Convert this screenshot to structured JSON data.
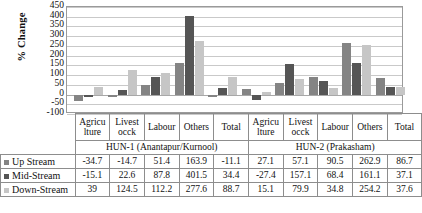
{
  "chart_data": {
    "type": "bar",
    "title": "",
    "xlabel": "",
    "ylabel": "% Change",
    "ylim": [
      -100,
      450
    ],
    "ytick_step": 50,
    "yticks": [
      450,
      400,
      350,
      300,
      250,
      200,
      150,
      100,
      50,
      0,
      -50,
      -100
    ],
    "grid": true,
    "legend_position": "data-table-left",
    "groups": [
      {
        "name": "HUN-1 (Anantapur/Kurnool)",
        "categories": [
          "Agricu lture",
          "Livest occk",
          "Labour",
          "Others",
          "Total"
        ]
      },
      {
        "name": "HUN-2 (Prakasham)",
        "categories": [
          "Agricu lture",
          "Livest occk",
          "Labour",
          "Others",
          "Total"
        ]
      }
    ],
    "categories": [
      "Agricu lture",
      "Livest occk",
      "Labour",
      "Others",
      "Total",
      "Agricu lture",
      "Livest occk",
      "Labour",
      "Others",
      "Total"
    ],
    "series": [
      {
        "name": "Up Stream",
        "color": "#848484",
        "values": [
          -34.7,
          -14.7,
          51.4,
          163.9,
          -11.1,
          27.1,
          57.1,
          90.5,
          262.9,
          86.7
        ]
      },
      {
        "name": "Mid-Stream",
        "color": "#555555",
        "values": [
          -15.1,
          22.6,
          87.8,
          401.5,
          34.4,
          -27.4,
          157.1,
          68.4,
          161.1,
          37.1
        ]
      },
      {
        "name": "Down-Stream",
        "color": "#c6c6c6",
        "values": [
          39,
          124.5,
          112.2,
          277.6,
          88.7,
          15.1,
          79.9,
          34.8,
          254.2,
          37.6
        ]
      }
    ]
  },
  "table": {
    "row_labels": [
      "Up Stream",
      "Mid-Stream",
      "Down-Stream"
    ],
    "rows": [
      [
        "-34.7",
        "-14.7",
        "51.4",
        "163.9",
        "-11.1",
        "27.1",
        "57.1",
        "90.5",
        "262.9",
        "86.7"
      ],
      [
        "-15.1",
        "22.6",
        "87.8",
        "401.5",
        "34.4",
        "-27.4",
        "157.1",
        "68.4",
        "161.1",
        "37.1"
      ],
      [
        "39",
        "124.5",
        "112.2",
        "277.6",
        "88.7",
        "15.1",
        "79.9",
        "34.8",
        "254.2",
        "37.6"
      ]
    ]
  }
}
